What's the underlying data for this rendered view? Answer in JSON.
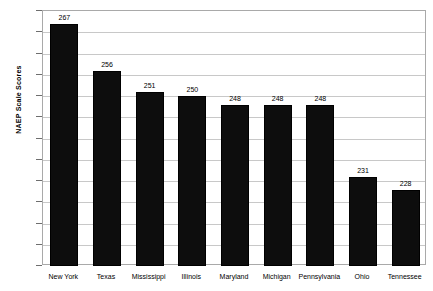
{
  "chart_data": {
    "type": "bar",
    "title": "",
    "xlabel": "",
    "ylabel": "NAEP Scale Scores",
    "ylim": [
      210,
      270
    ],
    "ytick_step": 5,
    "yticks": [
      210,
      215,
      220,
      225,
      230,
      235,
      240,
      245,
      250,
      255,
      260,
      265,
      270
    ],
    "categories": [
      "New York",
      "Texas",
      "Mississippi",
      "Illinois",
      "Maryland",
      "Michigan",
      "Pennsylvania",
      "Ohio",
      "Tennessee"
    ],
    "values": [
      267,
      256,
      251,
      250,
      248,
      248,
      248,
      231,
      228
    ],
    "grid": true,
    "grid_axis": "y",
    "legend": false,
    "bar_color": "#0d0d0d",
    "gridline_color": "#c8c8c8",
    "axis_color": "#a9a9a9",
    "background_color": "#ffffff",
    "data_labels": true
  }
}
